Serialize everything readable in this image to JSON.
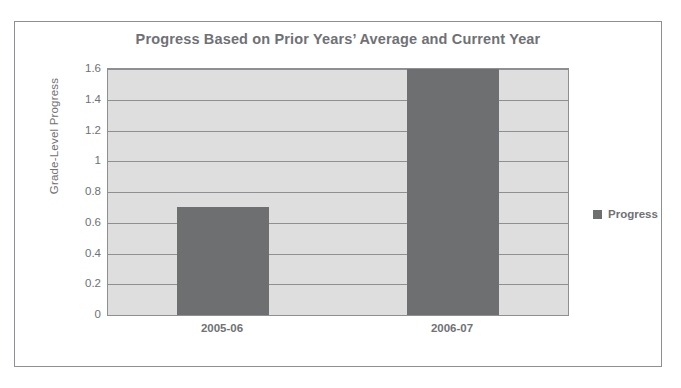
{
  "scan_artifact": {
    "top_strip_text": " "
  },
  "chart_data": {
    "type": "bar",
    "title": "Progress Based on Prior Years’ Average and Current Year",
    "xlabel": "",
    "ylabel": "Grade-Level Progress",
    "categories": [
      "2005-06",
      "2006-07"
    ],
    "series": [
      {
        "name": "Progress",
        "values": [
          0.7,
          1.75
        ],
        "color": "#6e6f70"
      }
    ],
    "values": [
      0.7,
      1.75
    ],
    "ylim": [
      0,
      1.6
    ],
    "ytick_values": [
      0,
      0.2,
      0.4,
      0.6,
      0.8,
      1,
      1.2,
      1.4,
      1.6
    ],
    "ytick_labels": [
      "0",
      "0.2",
      "0.4",
      "0.6",
      "0.8",
      "1",
      "1.2",
      "1.4",
      "1.6"
    ],
    "grid": true,
    "legend_position": "right",
    "plot_background": "#dddedd",
    "grid_color": "#8d8f92",
    "text_color": "#6f7175",
    "frame_color": "#8d8f92"
  },
  "legend": {
    "entries": [
      {
        "label": "Progress",
        "swatch_color": "#6e6f70"
      }
    ]
  }
}
